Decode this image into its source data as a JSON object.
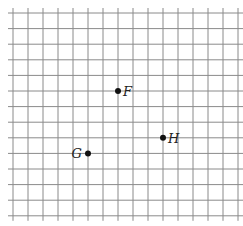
{
  "diagram": {
    "type": "grid_with_points",
    "grid": {
      "columns_lines": 16,
      "row_lines": 14,
      "origin_x": 13,
      "origin_y": 13,
      "spacing_x": 15,
      "spacing_y": 15.6,
      "overhang": 5,
      "line_color": "#8a8a8a"
    },
    "points": [
      {
        "label": "F",
        "col": 7,
        "row": 5,
        "label_side": "right"
      },
      {
        "label": "H",
        "col": 10,
        "row": 8,
        "label_side": "right"
      },
      {
        "label": "G",
        "col": 5,
        "row": 9,
        "label_side": "left"
      }
    ],
    "point_color": "#111111"
  }
}
